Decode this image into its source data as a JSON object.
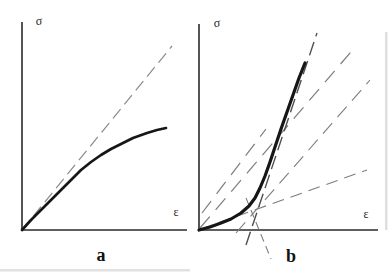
{
  "figure": {
    "background": "#ffffff",
    "axis_color": "#2b2b2b",
    "curve_color": "#161616",
    "panels": [
      {
        "id": "a",
        "axis_label_vertical": "σ",
        "axis_label_horizontal": "ε",
        "panel_label": "a",
        "axes": {
          "y_top": [
            22,
            22
          ],
          "origin": [
            22,
            230
          ],
          "x_end": [
            187,
            230
          ],
          "width": 1.6
        },
        "curve": {
          "points": [
            [
              22,
              230
            ],
            [
              31,
              220
            ],
            [
              41,
              210
            ],
            [
              51,
              200
            ],
            [
              61,
              190
            ],
            [
              71,
              180
            ],
            [
              81,
              170
            ],
            [
              91,
              162
            ],
            [
              101,
              155
            ],
            [
              111,
              149
            ],
            [
              121,
              144
            ],
            [
              133,
              138
            ],
            [
              147,
              133
            ],
            [
              157,
              130
            ],
            [
              166,
              128
            ]
          ],
          "width": 2.7
        },
        "dashed_lines": [
          {
            "name": "initial-tangent-line",
            "from": [
              22,
              230
            ],
            "to": [
              172,
              46
            ],
            "dash": "12 6",
            "width": 1.2,
            "color": "#8a8a8a"
          }
        ]
      },
      {
        "id": "b",
        "axis_label_vertical": "σ",
        "axis_label_horizontal": "ε",
        "panel_label": "b",
        "axes": {
          "y_top": [
            199,
            24
          ],
          "origin": [
            199,
            230
          ],
          "x_end": [
            378,
            230
          ],
          "width": 1.6
        },
        "curve": {
          "points": [
            [
              199,
              230
            ],
            [
              210,
              227
            ],
            [
              221,
              223
            ],
            [
              231,
              219
            ],
            [
              241,
              213
            ],
            [
              249,
              206
            ],
            [
              255,
              198
            ],
            [
              260,
              188
            ],
            [
              265,
              176
            ],
            [
              270,
              162
            ],
            [
              275,
              147
            ],
            [
              281,
              129
            ],
            [
              287,
              112
            ],
            [
              293,
              95
            ],
            [
              299,
              78
            ],
            [
              305,
              63
            ]
          ],
          "width": 3.2
        },
        "dashed_lines": [
          {
            "name": "initial-tangent-extended",
            "from": [
              201,
              229
            ],
            "to": [
              367,
              170
            ],
            "dash": "12 7",
            "width": 1.1,
            "color": "#7d7d7d"
          },
          {
            "name": "secant-through-origin",
            "from": [
              200,
              228
            ],
            "to": [
              356,
              46
            ],
            "dash": "15 9",
            "width": 1.2,
            "color": "#7d7d7d"
          },
          {
            "name": "upper-offset-diagonal",
            "from": [
              202,
              213
            ],
            "to": [
              266,
              129
            ],
            "dash": "15 9",
            "width": 1.2,
            "color": "#7d7d7d"
          },
          {
            "name": "lower-secant-diagonal",
            "from": [
              236,
              233
            ],
            "to": [
              370,
              80
            ],
            "dash": "14 8",
            "width": 1.1,
            "color": "#7d7d7d"
          },
          {
            "name": "steep-tangent-line",
            "from": [
              246,
              245
            ],
            "to": [
              317,
              33
            ],
            "dash": "14 6",
            "width": 1.4,
            "color": "#4f4f4f"
          },
          {
            "name": "knee-construction-segment",
            "from": [
              246,
              198
            ],
            "to": [
              271,
              259
            ],
            "dash": "8 5",
            "width": 1.1,
            "color": "#7d7d7d"
          }
        ]
      }
    ],
    "artifacts": [
      {
        "x": 0,
        "y": 269,
        "w": 190,
        "h": 2.5,
        "color": "#c9c9c9",
        "opacity": 0.55
      },
      {
        "x": 385,
        "y": 32,
        "w": 2.5,
        "h": 198,
        "color": "#c0c0c0",
        "opacity": 0.5
      }
    ]
  }
}
